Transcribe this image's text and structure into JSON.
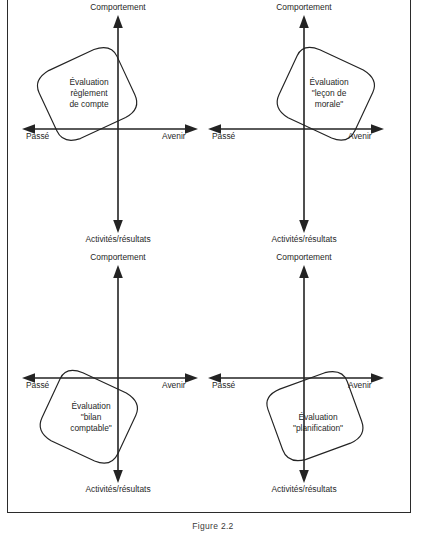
{
  "figure": {
    "caption": "Figure 2.2",
    "axis_labels": {
      "up": "Comportement",
      "down": "Activités/résultats",
      "left": "Passé",
      "right": "Avenir"
    },
    "quadrants": [
      {
        "id": "top-left",
        "blob_label_lines": [
          "Évaluation",
          "règlement",
          "de compte"
        ],
        "blob_position": "upper-left",
        "blob_rotation_deg": -25
      },
      {
        "id": "top-right",
        "blob_label_lines": [
          "Évaluation",
          "\"leçon de",
          "morale\""
        ],
        "blob_position": "upper-right",
        "blob_rotation_deg": 25
      },
      {
        "id": "bottom-left",
        "blob_label_lines": [
          "Évaluation",
          "\"bilan",
          "comptable\""
        ],
        "blob_position": "lower-left",
        "blob_rotation_deg": 25
      },
      {
        "id": "bottom-right",
        "blob_label_lines": [
          "Évaluation",
          "\"planification\""
        ],
        "blob_position": "lower-right",
        "blob_rotation_deg": -20
      }
    ]
  }
}
